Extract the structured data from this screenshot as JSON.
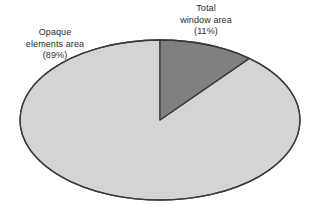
{
  "figure": {
    "background_color": "#ffffff",
    "outline_color": "#3a3a3a",
    "text_color": "#2b2b2b"
  },
  "labels": {
    "window": {
      "line1": "Total",
      "line2": "window area",
      "line3": "(11%)"
    },
    "opaque": {
      "line1": "Opaque",
      "line2": "elements area",
      "line3": "(89%)"
    }
  },
  "chart_data": {
    "type": "pie",
    "title": "",
    "subtitle": "",
    "xlabel": "",
    "ylabel": "",
    "grid": false,
    "legend_position": "none",
    "start_angle_deg": 0,
    "direction": "clockwise",
    "ellipse": {
      "cx": 160,
      "cy": 120,
      "rx": 140,
      "ry": 80
    },
    "categories": [
      "Total window area",
      "Opaque elements area"
    ],
    "values": [
      11,
      89
    ],
    "unit": "%",
    "slices": [
      {
        "name": "Total window area",
        "value": 11,
        "label": "(11%)",
        "color": "#808080",
        "start_deg": 0,
        "end_deg": 39.6
      },
      {
        "name": "Opaque elements area",
        "value": 89,
        "label": "(89%)",
        "color": "#d4d4d4",
        "start_deg": 39.6,
        "end_deg": 360
      }
    ]
  }
}
